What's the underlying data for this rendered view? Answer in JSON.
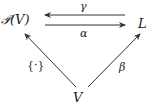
{
  "diagram": {
    "type": "commutative-diagram",
    "nodes": {
      "powerset": "𝒫(V)",
      "lattice": "L",
      "vertex": "V"
    },
    "edges": {
      "gamma": {
        "label": "γ",
        "from": "L",
        "to": "𝒫(V)"
      },
      "alpha": {
        "label": "α",
        "from": "𝒫(V)",
        "to": "L"
      },
      "singleton": {
        "label": "{·}",
        "from": "V",
        "to": "𝒫(V)"
      },
      "beta": {
        "label": "β",
        "from": "V",
        "to": "L"
      }
    },
    "colors": {
      "ink": "#1a1a1a",
      "background": "#ffffff"
    }
  }
}
